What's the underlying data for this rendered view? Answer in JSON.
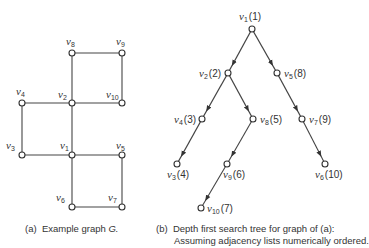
{
  "graph_a": {
    "caption_tag": "(a)",
    "caption_text": "Example graph",
    "caption_var": "G.",
    "nodes": [
      {
        "id": "v8",
        "name": "v",
        "sub": "8",
        "x": 72,
        "y": 53,
        "lx": 66,
        "ly": 45
      },
      {
        "id": "v9",
        "name": "v",
        "sub": "9",
        "x": 122,
        "y": 53,
        "lx": 116,
        "ly": 45
      },
      {
        "id": "v4",
        "name": "v",
        "sub": "4",
        "x": 22,
        "y": 103,
        "lx": 16,
        "ly": 95
      },
      {
        "id": "v2",
        "name": "v",
        "sub": "2",
        "x": 72,
        "y": 103,
        "lx": 58,
        "ly": 98
      },
      {
        "id": "v10",
        "name": "v",
        "sub": "10",
        "x": 122,
        "y": 103,
        "lx": 106,
        "ly": 98
      },
      {
        "id": "v3",
        "name": "v",
        "sub": "3",
        "x": 22,
        "y": 155,
        "lx": 6,
        "ly": 149
      },
      {
        "id": "v1",
        "name": "v",
        "sub": "1",
        "x": 72,
        "y": 155,
        "lx": 60,
        "ly": 149
      },
      {
        "id": "v5",
        "name": "v",
        "sub": "5",
        "x": 122,
        "y": 155,
        "lx": 116,
        "ly": 149
      },
      {
        "id": "v6",
        "name": "v",
        "sub": "6",
        "x": 72,
        "y": 207,
        "lx": 56,
        "ly": 201
      },
      {
        "id": "v7",
        "name": "v",
        "sub": "7",
        "x": 122,
        "y": 207,
        "lx": 108,
        "ly": 201
      }
    ],
    "edges": [
      [
        "v8",
        "v9"
      ],
      [
        "v9",
        "v10"
      ],
      [
        "v8",
        "v2"
      ],
      [
        "v2",
        "v10"
      ],
      [
        "v4",
        "v2"
      ],
      [
        "v4",
        "v3"
      ],
      [
        "v2",
        "v1"
      ],
      [
        "v3",
        "v1"
      ],
      [
        "v1",
        "v5"
      ],
      [
        "v5",
        "v7"
      ],
      [
        "v1",
        "v6"
      ],
      [
        "v6",
        "v7"
      ]
    ]
  },
  "tree_b": {
    "caption_tag": "(b)",
    "caption_line1": "Depth first search tree for graph of (a):",
    "caption_line2": "Assuming adjacency lists numerically ordered.",
    "nodes": [
      {
        "id": "v1",
        "sub": "1",
        "order": "(1)",
        "x": 252,
        "y": 29,
        "lx": 239,
        "ly": 20,
        "anchor": "start"
      },
      {
        "id": "v2",
        "sub": "2",
        "order": "(2)",
        "x": 228,
        "y": 73,
        "lx": 199,
        "ly": 77,
        "anchor": "start"
      },
      {
        "id": "v5",
        "sub": "5",
        "order": "(8)",
        "x": 277,
        "y": 73,
        "lx": 284,
        "ly": 77,
        "anchor": "start"
      },
      {
        "id": "v4",
        "sub": "4",
        "order": "(3)",
        "x": 202,
        "y": 119,
        "lx": 174,
        "ly": 123,
        "anchor": "start"
      },
      {
        "id": "v8",
        "sub": "8",
        "order": "(5)",
        "x": 253,
        "y": 119,
        "lx": 260,
        "ly": 123,
        "anchor": "start"
      },
      {
        "id": "v7",
        "sub": "7",
        "order": "(9)",
        "x": 302,
        "y": 119,
        "lx": 309,
        "ly": 123,
        "anchor": "start"
      },
      {
        "id": "v3",
        "sub": "3",
        "order": "(4)",
        "x": 177,
        "y": 164,
        "lx": 167,
        "ly": 178,
        "anchor": "start"
      },
      {
        "id": "v9",
        "sub": "9",
        "order": "(6)",
        "x": 227,
        "y": 164,
        "lx": 223,
        "ly": 178,
        "anchor": "start"
      },
      {
        "id": "v6",
        "sub": "6",
        "order": "(10)",
        "x": 325,
        "y": 164,
        "lx": 315,
        "ly": 178,
        "anchor": "start"
      },
      {
        "id": "v10",
        "sub": "10",
        "order": "(7)",
        "x": 201,
        "y": 208,
        "lx": 207,
        "ly": 212,
        "anchor": "start"
      }
    ],
    "edges": [
      [
        "v1",
        "v2"
      ],
      [
        "v1",
        "v5"
      ],
      [
        "v2",
        "v4"
      ],
      [
        "v2",
        "v8"
      ],
      [
        "v5",
        "v7"
      ],
      [
        "v4",
        "v3"
      ],
      [
        "v8",
        "v9"
      ],
      [
        "v7",
        "v6"
      ],
      [
        "v9",
        "v10"
      ]
    ]
  }
}
